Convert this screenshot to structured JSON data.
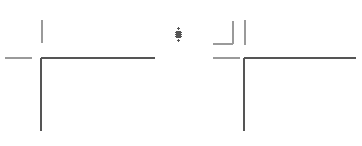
{
  "canvas": {
    "width": 362,
    "height": 146,
    "background_color": "#ffffff",
    "name": "drawing-canvas"
  },
  "style": {
    "stroke_dark": "#555555",
    "stroke_mid": "#6e6e6e",
    "stroke_light": "#9a9a9a",
    "stroke_width_main": 1.4,
    "stroke_width_thin": 1.0
  },
  "chart_data": {
    "type": "line",
    "title": "",
    "xlabel": "",
    "ylabel": "",
    "grid": false,
    "legend": null,
    "xlim": [
      0,
      362
    ],
    "ylim": [
      0,
      146
    ],
    "series": [
      {
        "name": "left-horizontal-stub",
        "color": "#9a9a9a",
        "width": 1.2,
        "x": [
          5,
          32
        ],
        "y": [
          58,
          58
        ]
      },
      {
        "name": "left-upper-vertical-stub",
        "color": "#9a9a9a",
        "width": 1.2,
        "x": [
          42,
          42
        ],
        "y": [
          20,
          43
        ]
      },
      {
        "name": "left-corner-horizontal",
        "color": "#555555",
        "width": 1.4,
        "x": [
          41,
          155
        ],
        "y": [
          58,
          58
        ]
      },
      {
        "name": "left-corner-vertical",
        "color": "#555555",
        "width": 1.4,
        "x": [
          41,
          41
        ],
        "y": [
          58,
          131
        ]
      },
      {
        "name": "right-elbow-horizontal",
        "color": "#9a9a9a",
        "width": 1.2,
        "x": [
          213,
          233
        ],
        "y": [
          44,
          44
        ]
      },
      {
        "name": "right-elbow-vertical",
        "color": "#9a9a9a",
        "width": 1.2,
        "x": [
          233,
          233
        ],
        "y": [
          21,
          44
        ]
      },
      {
        "name": "right-detached-vertical",
        "color": "#9a9a9a",
        "width": 1.2,
        "x": [
          245,
          245
        ],
        "y": [
          20,
          45
        ]
      },
      {
        "name": "right-horizontal-stub",
        "color": "#9a9a9a",
        "width": 1.2,
        "x": [
          213,
          240
        ],
        "y": [
          58,
          58
        ]
      },
      {
        "name": "right-corner-horizontal",
        "color": "#555555",
        "width": 1.4,
        "x": [
          244,
          356
        ],
        "y": [
          58,
          58
        ]
      },
      {
        "name": "right-corner-vertical",
        "color": "#555555",
        "width": 1.4,
        "x": [
          244,
          244
        ],
        "y": [
          58,
          131
        ]
      }
    ]
  },
  "cursor": {
    "name": "move-cursor",
    "icon": "move-cursor-icon",
    "x": 173,
    "y": 27,
    "width": 11,
    "height": 15,
    "color": "#555555"
  }
}
